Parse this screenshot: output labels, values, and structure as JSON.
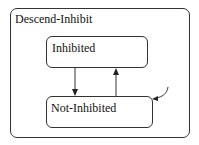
{
  "diagram": {
    "type": "statechart",
    "superstate": {
      "label": "Descend-Inhibit"
    },
    "states": [
      {
        "id": "inhibited",
        "label": "Inhibited"
      },
      {
        "id": "not-inhibited",
        "label": "Not-Inhibited",
        "default": true
      }
    ],
    "transitions": [
      {
        "from": "inhibited",
        "to": "not-inhibited"
      },
      {
        "from": "not-inhibited",
        "to": "inhibited"
      },
      {
        "from": "default",
        "to": "not-inhibited"
      }
    ]
  }
}
